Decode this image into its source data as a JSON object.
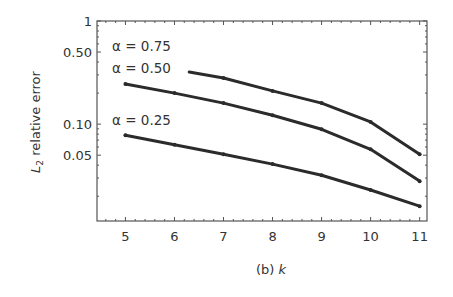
{
  "chart_data": {
    "type": "line",
    "title": "",
    "caption": "(b) k",
    "caption_prefix": "(b) ",
    "caption_var": "k",
    "xlabel": "k",
    "ylabel": "L2 relative error",
    "ylabel_main": "L",
    "ylabel_sub": "2",
    "ylabel_rest": " relative error",
    "xscale": "linear",
    "yscale": "log",
    "xlim": [
      4.42,
      11.15
    ],
    "ylim": [
      0.0115,
      1
    ],
    "xticks": [
      5,
      6,
      7,
      8,
      9,
      10,
      11
    ],
    "xtick_labels": [
      "5",
      "6",
      "7",
      "8",
      "9",
      "10",
      "11"
    ],
    "yticks": [
      1,
      0.5,
      0.1,
      0.05
    ],
    "ytick_labels": [
      "1",
      "0.50",
      "0.10",
      "0.05"
    ],
    "grid": false,
    "legend": "inline-labels",
    "series": [
      {
        "name": "α = 0.75",
        "x": [
          6.3,
          7,
          8,
          9,
          10,
          11
        ],
        "y": [
          0.32,
          0.28,
          0.21,
          0.16,
          0.105,
          0.051
        ]
      },
      {
        "name": "α = 0.50",
        "x": [
          5,
          6,
          7,
          8,
          9,
          10,
          11
        ],
        "y": [
          0.245,
          0.2,
          0.16,
          0.122,
          0.089,
          0.057,
          0.028
        ]
      },
      {
        "name": "α = 0.25",
        "x": [
          5,
          6,
          7,
          8,
          9,
          10,
          11
        ],
        "y": [
          0.078,
          0.063,
          0.051,
          0.041,
          0.032,
          0.023,
          0.016
        ]
      }
    ],
    "colors": {
      "line": "#2b2b2b",
      "axis": "#555555",
      "text": "#333333"
    }
  }
}
